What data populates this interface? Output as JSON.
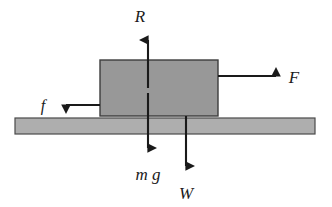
{
  "diagram": {
    "canvas": {
      "width": 332,
      "height": 207,
      "background": "#ffffff"
    },
    "colors": {
      "block_fill": "#989898",
      "block_stroke": "#3d3d3d",
      "ground_fill": "#aeaeae",
      "ground_stroke": "#4a4a4a",
      "arrow": "#1a1a1a",
      "text": "#1a1a1a"
    },
    "bodies": [
      {
        "name": "block",
        "shape": "rectangle",
        "x": 100,
        "y": 60,
        "width": 118,
        "height": 56,
        "fill": "#989898"
      },
      {
        "name": "ground-surface",
        "shape": "rectangle",
        "x": 15,
        "y": 118,
        "width": 300,
        "height": 16,
        "fill": "#aeaeae"
      }
    ],
    "forces": [
      {
        "id": "normal-reaction",
        "label": "R",
        "direction": "up",
        "tail": {
          "x": 148,
          "y": 88
        },
        "head": {
          "x": 148,
          "y": 30
        },
        "label_pos": {
          "x": 140,
          "y": 22
        }
      },
      {
        "id": "applied-force",
        "label": "F",
        "direction": "right",
        "tail": {
          "x": 218,
          "y": 76
        },
        "head": {
          "x": 286,
          "y": 76
        },
        "label_pos": {
          "x": 292,
          "y": 82
        }
      },
      {
        "id": "friction-force",
        "label": "f",
        "direction": "left",
        "tail": {
          "x": 100,
          "y": 105
        },
        "head": {
          "x": 56,
          "y": 105
        },
        "label_pos": {
          "x": 40,
          "y": 110
        }
      },
      {
        "id": "gravitational-force-mg",
        "label": "m g",
        "direction": "down",
        "tail": {
          "x": 148,
          "y": 93
        },
        "head": {
          "x": 148,
          "y": 158
        },
        "label_pos": {
          "x": 130,
          "y": 179
        }
      },
      {
        "id": "weight-force",
        "label": "W",
        "direction": "down",
        "tail": {
          "x": 186,
          "y": 116
        },
        "head": {
          "x": 186,
          "y": 176
        },
        "label_pos": {
          "x": 178,
          "y": 198
        }
      }
    ]
  }
}
